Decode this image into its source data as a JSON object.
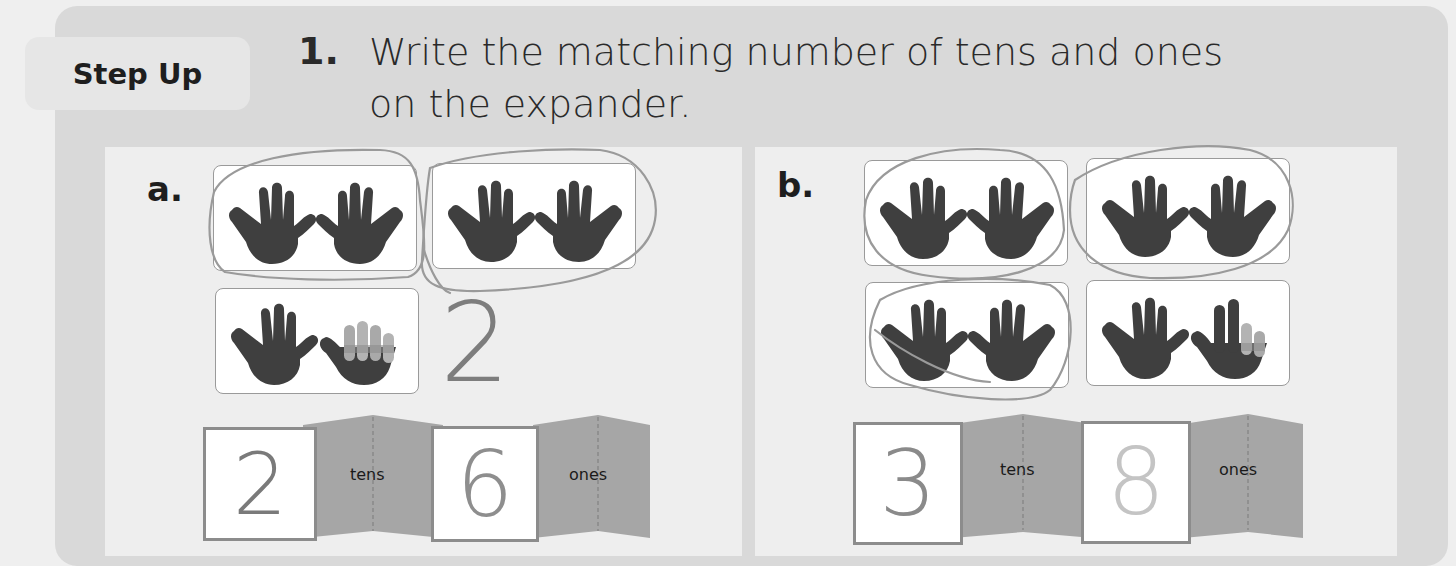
{
  "header": {
    "tab_label": "Step Up",
    "question_number": "1.",
    "instruction_line1": "Write the matching number of tens and ones",
    "instruction_line2": "on the expander."
  },
  "problems": [
    {
      "label": "a.",
      "hand_cards": [
        {
          "hands": [
            "full",
            "full"
          ],
          "circled": true
        },
        {
          "hands": [
            "full",
            "full"
          ],
          "circled": true
        },
        {
          "hands": [
            "full",
            "4-fingers-grayed"
          ],
          "circled": false
        }
      ],
      "margin_note": "2",
      "expander": {
        "tens_value": "2",
        "tens_label": "tens",
        "ones_value": "6",
        "ones_label": "ones"
      }
    },
    {
      "label": "b.",
      "hand_cards": [
        {
          "hands": [
            "full",
            "full"
          ],
          "circled": true
        },
        {
          "hands": [
            "full",
            "full"
          ],
          "circled": true
        },
        {
          "hands": [
            "full",
            "full"
          ],
          "circled": true
        },
        {
          "hands": [
            "full",
            "2-fingers-grayed"
          ],
          "circled": false
        }
      ],
      "expander": {
        "tens_value": "3",
        "tens_label": "tens",
        "ones_value": "8",
        "ones_label": "ones"
      }
    }
  ],
  "colors": {
    "hand_dark": "#3f3f3f",
    "hand_gray_finger": "#a9a9a9",
    "expander_fold": "#a6a6a6",
    "pencil": "#8a8a8a"
  }
}
